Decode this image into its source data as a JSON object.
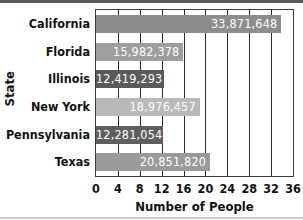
{
  "chart_data": {
    "type": "bar",
    "orientation": "horizontal",
    "title": "",
    "xlabel": "Number of People",
    "ylabel": "State",
    "x_tick_labels": [
      "0",
      "4",
      "8",
      "12",
      "16",
      "20",
      "24",
      "28",
      "32",
      "36"
    ],
    "xlim": [
      0,
      36
    ],
    "grid": true,
    "legend": null,
    "categories": [
      "California",
      "Florida",
      "Illinois",
      "New York",
      "Pennsylvania",
      "Texas"
    ],
    "values": [
      33871648,
      15982378,
      12419293,
      18976457,
      12281054,
      20851820
    ],
    "data_labels": [
      "33,871,648",
      "15,982,378",
      "12,419,293",
      "18,976,457",
      "12,281,054",
      "20,851,820"
    ],
    "bar_colors": [
      "#8d8d8d",
      "#9e9e9e",
      "#5a5a5a",
      "#b9b9b9",
      "#5f5f5f",
      "#9a9a9a"
    ],
    "units_note": "axis in millions"
  }
}
